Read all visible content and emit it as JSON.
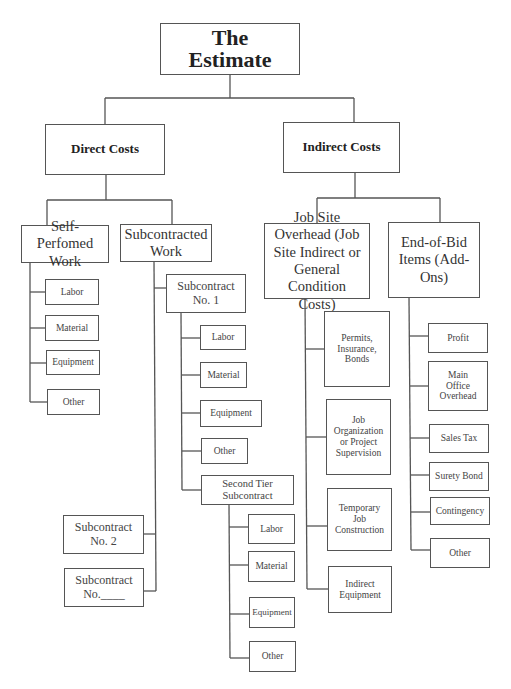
{
  "root": {
    "label": "The Estimate",
    "line1": "The",
    "line2": "Estimate"
  },
  "direct": {
    "label": "Direct Costs",
    "self_performed": {
      "label": "Self-Perfomed Work",
      "items": [
        "Labor",
        "Material",
        "Equipment",
        "Other"
      ]
    },
    "subcontracted": {
      "label": "Subcontracted Work",
      "sub1": {
        "label": "Subcontract No. 1",
        "items": [
          "Labor",
          "Material",
          "Equipment",
          "Other"
        ],
        "second_tier": {
          "label": "Second Tier Subcontract",
          "items": [
            "Labor",
            "Material",
            "Equipment",
            "Other"
          ]
        }
      },
      "sub2": {
        "label": "Subcontract No. 2"
      },
      "subN": {
        "label": "Subcontract No.____"
      }
    }
  },
  "indirect": {
    "label": "Indirect Costs",
    "job_site": {
      "label": "Job Site Overhead (Job Site Indirect or General Condition Costs)",
      "items": [
        "Permits, Insurance, Bonds",
        "Job Organization or Project Supervision",
        "Temporary Job Construction",
        "Indirect Equipment"
      ]
    },
    "end_of_bid": {
      "label": "End-of-Bid Items (Add-Ons)",
      "items": [
        "Profit",
        "Main Office Overhead",
        "Sales Tax",
        "Surety Bond",
        "Contingency",
        "Other"
      ]
    }
  }
}
